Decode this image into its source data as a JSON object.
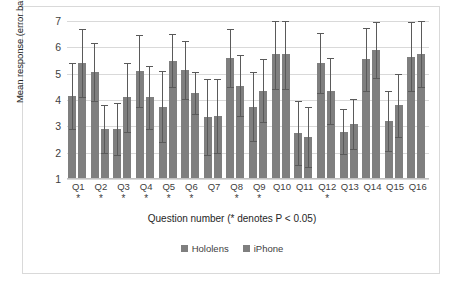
{
  "chart_data": {
    "type": "bar",
    "title": "",
    "xlabel": "Question number (* denotes P < 0.05)",
    "ylabel": "Mean response (error bar denotes stdev)",
    "categories": [
      "Q1",
      "Q2",
      "Q3",
      "Q4",
      "Q5",
      "Q6",
      "Q7",
      "Q8",
      "Q9",
      "Q10",
      "Q11",
      "Q12",
      "Q13",
      "Q14",
      "Q15",
      "Q16"
    ],
    "significance_markers": [
      "*",
      "*",
      "*",
      "*",
      "*",
      "*",
      "",
      "*",
      "*",
      "",
      "",
      "*",
      "",
      "",
      "",
      ""
    ],
    "ylim": [
      1,
      7
    ],
    "yticks": [
      1,
      2,
      3,
      4,
      5,
      6,
      7
    ],
    "grid": true,
    "legend_position": "bottom",
    "series": [
      {
        "name": "Hololens",
        "color": "#7f7f7f",
        "values": [
          4.15,
          5.05,
          2.9,
          5.1,
          3.75,
          5.15,
          3.35,
          5.6,
          3.75,
          5.75,
          2.75,
          5.4,
          2.8,
          5.55,
          3.2,
          5.65
        ],
        "errors": [
          1.25,
          1.1,
          1.0,
          1.35,
          1.35,
          1.1,
          1.45,
          1.1,
          1.3,
          1.35,
          1.2,
          1.15,
          0.85,
          1.2,
          1.15,
          1.3
        ]
      },
      {
        "name": "iPhone",
        "color": "#7f7f7f",
        "values": [
          5.4,
          2.9,
          4.1,
          4.1,
          5.5,
          4.25,
          3.4,
          4.55,
          4.35,
          5.75,
          2.6,
          4.35,
          3.1,
          5.9,
          3.8,
          5.75
        ],
        "errors": [
          1.3,
          0.9,
          1.3,
          1.2,
          1.0,
          0.8,
          1.4,
          1.15,
          1.2,
          1.35,
          1.15,
          1.25,
          0.95,
          1.05,
          1.2,
          1.25
        ]
      }
    ]
  },
  "legend": {
    "items": [
      {
        "label": "Hololens"
      },
      {
        "label": "iPhone"
      }
    ]
  }
}
